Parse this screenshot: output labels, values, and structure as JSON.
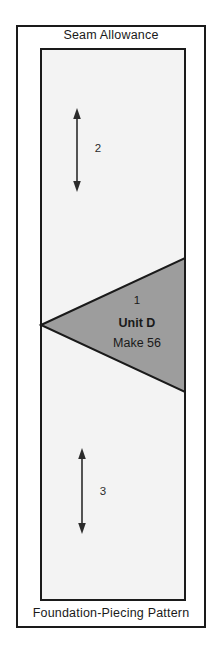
{
  "diagram": {
    "type": "foundation-piecing-pattern",
    "top_label": "Seam Allowance",
    "bottom_label": "Foundation-Piecing Pattern",
    "colors": {
      "line": "#1a1a1a",
      "unit_fill": "#9d9d9d",
      "block_background": "#f3f3f3",
      "page_background": "#ffffff",
      "arrow": "#2b2b2b"
    },
    "outer_frame": {
      "name": "seam-allowance-frame",
      "x": 16,
      "y": 25,
      "width": 190,
      "height": 603
    },
    "inner_block": {
      "name": "finished-block",
      "x": 40,
      "y": 48,
      "width": 146,
      "height": 553
    },
    "unit": {
      "number": "1",
      "name": "Unit D",
      "make": "Make 56",
      "shape": "triangle",
      "apex": {
        "x": 41,
        "y": 325
      },
      "top_right": {
        "x": 185,
        "y": 258
      },
      "bottom_right": {
        "x": 185,
        "y": 392
      }
    },
    "sections": [
      {
        "number": "2",
        "label": "2",
        "arrow": "double-headed-vertical",
        "x": 77,
        "y_top": 110,
        "y_bottom": 190
      },
      {
        "number": "1",
        "label": "1",
        "arrow": "none"
      },
      {
        "number": "3",
        "label": "3",
        "arrow": "double-headed-vertical",
        "x": 82,
        "y_top": 450,
        "y_bottom": 532
      }
    ]
  }
}
